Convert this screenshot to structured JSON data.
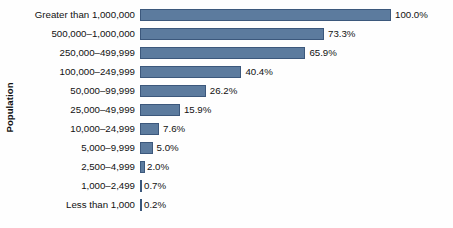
{
  "chart_data": {
    "type": "bar",
    "orientation": "horizontal",
    "title": "",
    "xlabel": "",
    "ylabel": "Population",
    "xlim": [
      0,
      100
    ],
    "grid": false,
    "legend": null,
    "value_suffix": "%",
    "categories": [
      "Greater than 1,000,000",
      "500,000–1,000,000",
      "250,000–499,999",
      "100,000–249,999",
      "50,000–99,999",
      "25,000–49,999",
      "10,000–24,999",
      "5,000–9,999",
      "2,500–4,999",
      "1,000–2,499",
      "Less than 1,000"
    ],
    "values": [
      100.0,
      73.3,
      65.9,
      40.4,
      26.2,
      15.9,
      7.6,
      5.0,
      2.0,
      0.7,
      0.2
    ],
    "value_labels": [
      "100.0%",
      "73.3%",
      "65.9%",
      "40.4%",
      "26.2%",
      "15.9%",
      "7.6%",
      "5.0%",
      "2.0%",
      "0.7%",
      "0.2%"
    ],
    "bar_color": "#5c7b9e",
    "bar_border_color": "#3c587c",
    "background_color": "#fefefe",
    "text_color": "#111111"
  }
}
